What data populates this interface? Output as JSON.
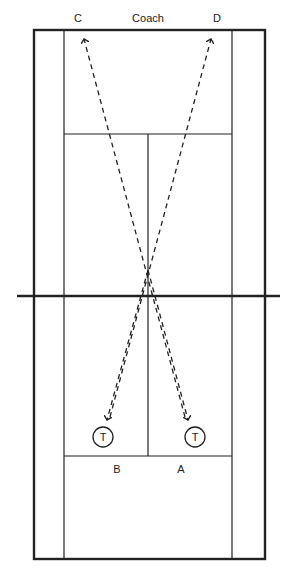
{
  "diagram": {
    "labels": {
      "top_left": "C",
      "top_center": "Coach",
      "top_right": "D",
      "bottom_left": "B",
      "bottom_right": "A"
    },
    "players": [
      {
        "id": "player-b",
        "symbol": "T",
        "cx": 103,
        "cy": 437
      },
      {
        "id": "player-a",
        "symbol": "T",
        "cx": 195,
        "cy": 437
      }
    ],
    "colors": {
      "line": "#222222",
      "background": "#ffffff"
    }
  }
}
